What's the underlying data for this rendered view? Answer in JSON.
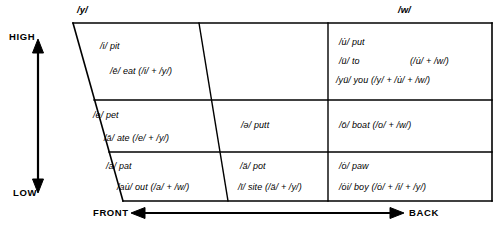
{
  "diagram": {
    "title_visible": false,
    "type": "vowel-trapezoid",
    "axes": {
      "vertical": {
        "top_label": "HIGH",
        "bottom_label": "LOW",
        "icon": "double-arrow-vertical"
      },
      "horizontal": {
        "left_label": "FRONT",
        "right_label": "BACK",
        "icon": "double-arrow-horizontal"
      }
    },
    "glides": {
      "front": "/y/",
      "back": "/w/"
    },
    "colors": {
      "ink": "#000000",
      "background": "#ffffff"
    },
    "cells": [
      {
        "id": "front-high",
        "column": "front",
        "row": "high",
        "lines": [
          {
            "text": "/i/ pit",
            "derivation": ""
          },
          {
            "text": "/ē/ eat",
            "derivation": "(/i/ + /y/)"
          }
        ]
      },
      {
        "id": "central-high",
        "column": "central",
        "row": "high",
        "lines": []
      },
      {
        "id": "back-high",
        "column": "back",
        "row": "high",
        "lines": [
          {
            "text": "/u̇/ put",
            "derivation": ""
          },
          {
            "text": "/ü/ to",
            "derivation": "(/u̇/ + /w/)"
          },
          {
            "text": "/yü/ you",
            "derivation": "(/y/ + /u̇/ + /w/)"
          }
        ]
      },
      {
        "id": "front-mid",
        "column": "front",
        "row": "mid",
        "lines": [
          {
            "text": "/e/ pet",
            "derivation": ""
          },
          {
            "text": "/ā/ ate",
            "derivation": "(/e/ + /y/)"
          }
        ]
      },
      {
        "id": "central-mid",
        "column": "central",
        "row": "mid",
        "lines": [
          {
            "text": "/ə/ putt",
            "derivation": ""
          }
        ]
      },
      {
        "id": "back-mid",
        "column": "back",
        "row": "mid",
        "lines": [
          {
            "text": "/ō/ boat",
            "derivation": "(/o/ + /w/)"
          }
        ]
      },
      {
        "id": "front-low",
        "column": "front",
        "row": "low",
        "lines": [
          {
            "text": "/a/ pat",
            "derivation": ""
          },
          {
            "text": "/au̇/ out",
            "derivation": "(/a/ + /w/)"
          }
        ]
      },
      {
        "id": "central-low",
        "column": "central",
        "row": "low",
        "lines": [
          {
            "text": "/ä/ pot",
            "derivation": ""
          },
          {
            "text": "/ī/ site",
            "derivation": "(/ä/ + /y/)"
          }
        ]
      },
      {
        "id": "back-low",
        "column": "back",
        "row": "low",
        "lines": [
          {
            "text": "/ȯ/ paw",
            "derivation": ""
          },
          {
            "text": "/ȯi/ boy",
            "derivation": "(/ȯ/ + /i/ + /y/)"
          }
        ]
      }
    ],
    "text_runs": {
      "fh_1": "/i/ pit",
      "fh_2": "/ē/ eat (/i/ + /y/)",
      "bh_1": "/u̇/ put",
      "bh_2a": "/ü/ to",
      "bh_2b": "(/u̇/ + /w/)",
      "bh_3": "/yü/ you (/y/ + /u̇/ + /w/)",
      "fm_1": "/e/ pet",
      "fm_2": "/ā/ ate (/e/ + /y/)",
      "cm_1": "/ə/ putt",
      "bm_1": "/ō/ boat (/o/ + /w/)",
      "fl_1": "/a/ pat",
      "fl_2": "/au̇/ out (/a/ + /w/)",
      "cl_1": "/ä/ pot",
      "cl_2": "/ī/ site (/ä/ + /y/)",
      "bl_1": "/ȯ/ paw",
      "bl_2": "/ȯi/ boy (/ȯ/ + /i/ + /y/)"
    }
  }
}
